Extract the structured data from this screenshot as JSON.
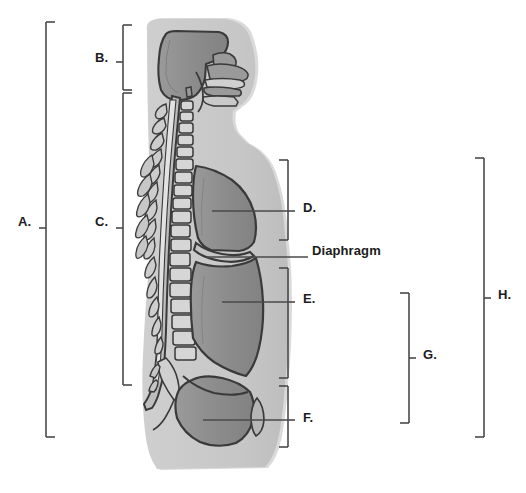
{
  "figure": {
    "view": "midsagittal"
  },
  "colors": {
    "background": "#ffffff",
    "body_silhouette": "#c9c9c9",
    "body_silhouette_shadow": "#bdbdbd",
    "cavity_fill": "#8d8d8d",
    "cavity_fill_dark": "#7e7e7e",
    "bone_fill": "#d2d2d2",
    "outline": "#3a3a3a",
    "bracket": "#4a4a4a",
    "label_text": "#1b1b1b"
  },
  "labels": [
    {
      "id": "A",
      "text": "A.",
      "kind": "bracket",
      "x": 18,
      "y": 222,
      "bracket": {
        "x": 46,
        "top": 22,
        "bottom": 437,
        "tick_y": 228,
        "dir": "right"
      }
    },
    {
      "id": "B",
      "text": "B.",
      "kind": "bracket",
      "x": 95,
      "y": 58,
      "bracket": {
        "x": 123,
        "top": 25,
        "bottom": 90,
        "tick_y": 62,
        "dir": "right"
      }
    },
    {
      "id": "C",
      "text": "C.",
      "kind": "bracket",
      "x": 95,
      "y": 222,
      "bracket": {
        "x": 123,
        "top": 93,
        "bottom": 385,
        "tick_y": 228,
        "dir": "right"
      }
    },
    {
      "id": "D",
      "text": "D.",
      "kind": "bracket",
      "x": 303,
      "y": 208,
      "bracket": {
        "x": 288,
        "top": 160,
        "bottom": 240,
        "tick_y": 211,
        "dir": "left"
      },
      "leader": {
        "x1": 212,
        "y1": 211,
        "x2": 288,
        "y2": 211
      }
    },
    {
      "id": "Diaphragm",
      "text": "Diaphragm",
      "kind": "leader",
      "x": 312,
      "y": 251,
      "leader": {
        "x1": 206,
        "y1": 257,
        "x2": 308,
        "y2": 257
      }
    },
    {
      "id": "E",
      "text": "E.",
      "kind": "bracket",
      "x": 303,
      "y": 299,
      "bracket": {
        "x": 288,
        "top": 268,
        "bottom": 378,
        "tick_y": 302,
        "dir": "left"
      },
      "leader": {
        "x1": 222,
        "y1": 302,
        "x2": 288,
        "y2": 302
      }
    },
    {
      "id": "F",
      "text": "F.",
      "kind": "bracket",
      "x": 303,
      "y": 418,
      "bracket": {
        "x": 288,
        "top": 386,
        "bottom": 447,
        "tick_y": 420,
        "dir": "left"
      },
      "leader": {
        "x1": 203,
        "y1": 420,
        "x2": 288,
        "y2": 420
      }
    },
    {
      "id": "G",
      "text": "G.",
      "kind": "bracket",
      "x": 423,
      "y": 355,
      "bracket": {
        "x": 409,
        "top": 293,
        "bottom": 423,
        "tick_y": 358,
        "dir": "left"
      }
    },
    {
      "id": "H",
      "text": "H.",
      "kind": "bracket",
      "x": 498,
      "y": 295,
      "bracket": {
        "x": 484,
        "top": 158,
        "bottom": 437,
        "tick_y": 298,
        "dir": "left"
      }
    }
  ],
  "regions": [
    {
      "name": "cranial-cavity",
      "label_ref": "B"
    },
    {
      "name": "vertebral-canal",
      "label_ref": "C"
    },
    {
      "name": "thoracic-cavity",
      "label_ref": "D"
    },
    {
      "name": "diaphragm",
      "label_ref": "Diaphragm"
    },
    {
      "name": "abdominal-cavity",
      "label_ref": "E"
    },
    {
      "name": "pelvic-cavity",
      "label_ref": "F"
    },
    {
      "name": "abdominopelvic-cavity",
      "label_ref": "G"
    },
    {
      "name": "ventral-cavity",
      "label_ref": "H"
    },
    {
      "name": "dorsal-cavity",
      "label_ref": "A"
    }
  ]
}
